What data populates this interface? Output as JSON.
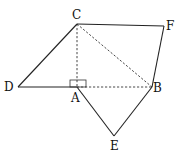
{
  "diagram": {
    "type": "geometry-figure",
    "points": {
      "A": {
        "label": "A",
        "x": 77,
        "y": 87
      },
      "B": {
        "label": "B",
        "x": 152,
        "y": 87
      },
      "C": {
        "label": "C",
        "x": 77,
        "y": 24
      },
      "D": {
        "label": "D",
        "x": 18,
        "y": 87
      },
      "E": {
        "label": "E",
        "x": 114,
        "y": 136
      },
      "F": {
        "label": "F",
        "x": 164,
        "y": 26
      }
    },
    "solid_segments": [
      [
        "D",
        "C"
      ],
      [
        "C",
        "F"
      ],
      [
        "F",
        "B"
      ],
      [
        "D",
        "A"
      ],
      [
        "A",
        "E"
      ],
      [
        "E",
        "B"
      ]
    ],
    "dashed_segments": [
      [
        "C",
        "A"
      ],
      [
        "C",
        "B"
      ],
      [
        "A",
        "B"
      ]
    ],
    "right_angle_at": "A",
    "labels": {
      "A": "A",
      "B": "B",
      "C": "C",
      "D": "D",
      "E": "E",
      "F": "F"
    }
  }
}
